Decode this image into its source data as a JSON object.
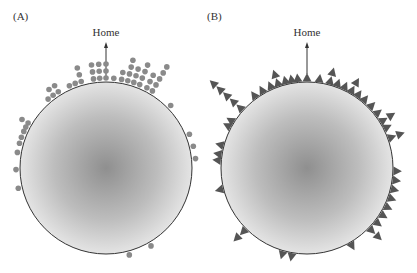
{
  "figure": {
    "panels": [
      {
        "id": "A",
        "label": "(A)",
        "home_label": "Home",
        "marker": "dot",
        "circle": {
          "cx": 106,
          "cy": 168,
          "r": 86
        },
        "home_arrow": {
          "x": 106,
          "y1": 80,
          "y2": 43
        }
      },
      {
        "id": "B",
        "label": "(B)",
        "home_label": "Home",
        "marker": "triangle",
        "circle": {
          "cx": 307,
          "cy": 168,
          "r": 86
        },
        "home_arrow": {
          "x": 307,
          "y1": 74,
          "y2": 43
        }
      }
    ],
    "colors": {
      "dot": "#8a8a8a",
      "triangle": "#555555",
      "circle_center": "#8f8f8f",
      "circle_edge": "#e6e6e6",
      "outline": "#333333"
    }
  }
}
